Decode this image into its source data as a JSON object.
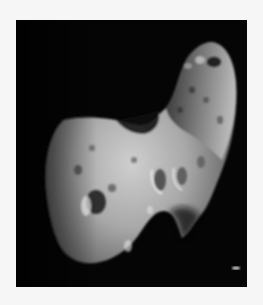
{
  "image": {
    "subject": "asteroid",
    "description": "Grayscale photograph of an elongated, cratered asteroid against a black sky",
    "colors": {
      "border": "#f6f6f6",
      "sky": "#050505",
      "surface_light": "#c9c9c9",
      "surface_mid": "#8a8a8a",
      "surface_dark": "#3a3a3a"
    }
  }
}
